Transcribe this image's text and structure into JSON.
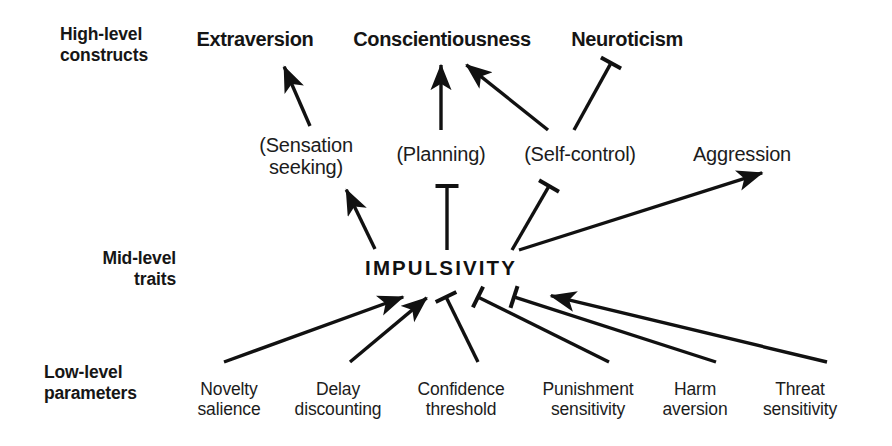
{
  "figure": {
    "background_color": "#ffffff",
    "line_color": "#111111"
  },
  "row_labels": [
    {
      "id": "high-level",
      "text": "High-level\nconstructs",
      "x": 60,
      "y": 24,
      "align": "left"
    },
    {
      "id": "mid-level",
      "text": "Mid-level\ntraits",
      "x": 58,
      "y": 248,
      "align": "right",
      "width": 118
    },
    {
      "id": "low-level",
      "text": "Low-level\nparameters",
      "x": 44,
      "y": 362,
      "align": "left"
    }
  ],
  "nodes": {
    "high_level": [
      {
        "id": "extraversion",
        "label": "Extraversion",
        "x": 255,
        "y": 28
      },
      {
        "id": "conscientiousness",
        "label": "Conscientiousness",
        "x": 442,
        "y": 28
      },
      {
        "id": "neuroticism",
        "label": "Neuroticism",
        "x": 627,
        "y": 28
      }
    ],
    "mid_level": [
      {
        "id": "sensation-seeking",
        "label": "(Sensation\nseeking)",
        "x": 306,
        "y": 134
      },
      {
        "id": "planning",
        "label": "(Planning)",
        "x": 441,
        "y": 143
      },
      {
        "id": "self-control",
        "label": "(Self-control)",
        "x": 580,
        "y": 143
      },
      {
        "id": "aggression",
        "label": "Aggression",
        "x": 742,
        "y": 143
      }
    ],
    "core": {
      "id": "impulsivity",
      "label": "IMPULSIVITY",
      "x": 437,
      "y": 257
    },
    "low_level": [
      {
        "id": "novelty-salience",
        "label": "Novelty\nsalience",
        "x": 229,
        "y": 380
      },
      {
        "id": "delay-discounting",
        "label": "Delay\ndiscounting",
        "x": 338,
        "y": 380
      },
      {
        "id": "confidence-threshold",
        "label": "Confidence\nthreshold",
        "x": 461,
        "y": 380
      },
      {
        "id": "punishment-sensitivity",
        "label": "Punishment\nsensitivity",
        "x": 588,
        "y": 380
      },
      {
        "id": "harm-aversion",
        "label": "Harm\naversion",
        "x": 695,
        "y": 380
      },
      {
        "id": "threat-sensitivity",
        "label": "Threat\nsensitivity",
        "x": 800,
        "y": 380
      }
    ]
  },
  "edges": [
    {
      "id": "sensation-seeking-to-extraversion",
      "from": "sensation-seeking",
      "to": "extraversion",
      "kind": "excitatory",
      "x1": 310,
      "y1": 126,
      "x2": 283,
      "y2": 64
    },
    {
      "id": "planning-to-conscientiousness",
      "from": "planning",
      "to": "conscientiousness",
      "kind": "excitatory",
      "x1": 441,
      "y1": 130,
      "x2": 441,
      "y2": 62
    },
    {
      "id": "self-control-to-conscientiousness",
      "from": "self-control",
      "to": "conscientiousness",
      "kind": "excitatory",
      "x1": 548,
      "y1": 130,
      "x2": 464,
      "y2": 63
    },
    {
      "id": "self-control-to-neuroticism",
      "from": "self-control",
      "to": "neuroticism",
      "kind": "inhibitory",
      "x1": 574,
      "y1": 130,
      "x2": 611,
      "y2": 63
    },
    {
      "id": "impulsivity-to-sensation-seeking",
      "from": "impulsivity",
      "to": "sensation-seeking",
      "kind": "excitatory",
      "x1": 375,
      "y1": 249,
      "x2": 345,
      "y2": 187
    },
    {
      "id": "impulsivity-to-planning",
      "from": "impulsivity",
      "to": "planning",
      "kind": "inhibitory",
      "x1": 447,
      "y1": 250,
      "x2": 447,
      "y2": 186
    },
    {
      "id": "impulsivity-to-self-control",
      "from": "impulsivity",
      "to": "self-control",
      "kind": "inhibitory",
      "x1": 512,
      "y1": 250,
      "x2": 549,
      "y2": 186
    },
    {
      "id": "impulsivity-to-aggression",
      "from": "impulsivity",
      "to": "aggression",
      "kind": "excitatory",
      "x1": 519,
      "y1": 250,
      "x2": 765,
      "y2": 172
    },
    {
      "id": "novelty-salience-to-impulsivity",
      "from": "novelty-salience",
      "to": "impulsivity",
      "kind": "excitatory",
      "x1": 224,
      "y1": 362,
      "x2": 406,
      "y2": 296
    },
    {
      "id": "delay-discounting-to-impulsivity",
      "from": "delay-discounting",
      "to": "impulsivity",
      "kind": "excitatory",
      "x1": 350,
      "y1": 362,
      "x2": 429,
      "y2": 296
    },
    {
      "id": "confidence-threshold-to-impulsivity",
      "from": "confidence-threshold",
      "to": "impulsivity",
      "kind": "inhibitory",
      "x1": 478,
      "y1": 362,
      "x2": 446,
      "y2": 297
    },
    {
      "id": "punishment-sensitivity-to-impulsivity",
      "from": "punishment-sensitivity",
      "to": "impulsivity",
      "kind": "inhibitory",
      "x1": 609,
      "y1": 362,
      "x2": 478,
      "y2": 297
    },
    {
      "id": "harm-aversion-to-impulsivity",
      "from": "harm-aversion",
      "to": "impulsivity",
      "kind": "inhibitory",
      "x1": 716,
      "y1": 362,
      "x2": 514,
      "y2": 297
    },
    {
      "id": "threat-sensitivity-to-impulsivity",
      "from": "threat-sensitivity",
      "to": "impulsivity",
      "kind": "excitatory",
      "x1": 827,
      "y1": 362,
      "x2": 548,
      "y2": 295
    }
  ]
}
